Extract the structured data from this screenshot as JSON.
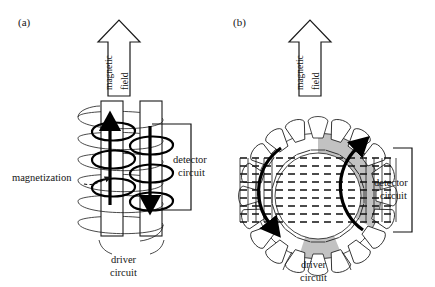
{
  "figure": {
    "background_color": "#ffffff",
    "ink_color": "#111111",
    "shade_color": "#c2c2c2",
    "width_px": 435,
    "height_px": 287
  },
  "panels": [
    {
      "id": "a",
      "label": "(a)",
      "core_type": "rod",
      "field_arrow": {
        "direction": "up",
        "style": "hollow-outline",
        "words": [
          "magnetic",
          "field"
        ],
        "text_orientation": "rotated-90-ccw"
      },
      "annotations": [
        {
          "name": "magnetization",
          "text": "magnetization",
          "leader": "dashed-with-arrowhead"
        },
        {
          "name": "detector-circuit",
          "line1": "detector",
          "line2": "circuit",
          "leader": "solid-bracket"
        },
        {
          "name": "driver-circuit",
          "line1": "driver",
          "line2": "circuit",
          "leader": "two-curved-leaders"
        }
      ],
      "magnetization_arrows": [
        {
          "core": "left",
          "direction": "up"
        },
        {
          "core": "right",
          "direction": "down"
        }
      ],
      "driver_turns": 6,
      "detector_turns": 4
    },
    {
      "id": "b",
      "label": "(b)",
      "core_type": "toroid",
      "field_arrow": {
        "direction": "up",
        "style": "hollow-outline",
        "words": [
          "magnetic",
          "field"
        ],
        "text_orientation": "rotated-90-ccw"
      },
      "annotations": [
        {
          "name": "detector-circuit",
          "line1": "detector",
          "line2": "circuit",
          "leader": "solid-bracket"
        },
        {
          "name": "driver-circuit",
          "line1": "driver",
          "line2": "circuit",
          "leader": "two-curved-leaders"
        }
      ],
      "magnetization_arrows": [
        {
          "side": "left",
          "direction": "clockwise-down"
        },
        {
          "side": "right",
          "direction": "counterclockwise-up"
        }
      ],
      "driver_turns": 20,
      "detector_turns": 11,
      "shaded_sectors": 2
    }
  ],
  "shared_labels": {
    "magnetic": "magnetic",
    "field": "field",
    "detector": "detector",
    "circuit": "circuit",
    "driver": "driver",
    "magnetization": "magnetization"
  }
}
